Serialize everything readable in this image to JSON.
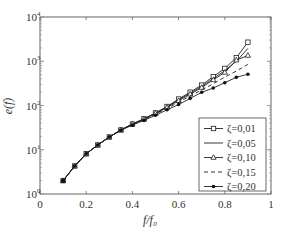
{
  "chart_data": {
    "type": "line",
    "title": "",
    "xlabel": "f/f0",
    "ylabel": "e(f)",
    "xlim": [
      0,
      1
    ],
    "ylim": [
      1,
      10000
    ],
    "yscale": "log",
    "grid": false,
    "legend_position": "lower right",
    "x_ticks": [
      "0",
      "0.2",
      "0.4",
      "0.6",
      "0.8",
      "1"
    ],
    "y_ticks": [
      "10^0",
      "10^1",
      "10^2",
      "10^3",
      "10^4"
    ],
    "x": [
      0.1,
      0.15,
      0.2,
      0.25,
      0.3,
      0.35,
      0.4,
      0.45,
      0.5,
      0.55,
      0.6,
      0.65,
      0.7,
      0.75,
      0.8,
      0.85,
      0.9
    ],
    "series": [
      {
        "name": "ζ=0,01",
        "marker": "square",
        "dash": "solid",
        "values": [
          2,
          4.3,
          8.1,
          12.8,
          19.4,
          28,
          38,
          50,
          68,
          95,
          140,
          200,
          290,
          450,
          690,
          1200,
          2700
        ]
      },
      {
        "name": "ζ=0,05",
        "marker": "none",
        "dash": "solid",
        "values": [
          2,
          4.3,
          8.1,
          12.8,
          19.4,
          28,
          38,
          50,
          67,
          93,
          135,
          190,
          270,
          410,
          610,
          1000,
          1950
        ]
      },
      {
        "name": "ζ=0,10",
        "marker": "triangle",
        "dash": "solid",
        "values": [
          2,
          4.3,
          8.1,
          12.8,
          19.4,
          28,
          38,
          49,
          66,
          90,
          128,
          180,
          255,
          380,
          560,
          1060,
          1350
        ]
      },
      {
        "name": "ζ=0,15",
        "marker": "none",
        "dash": "dashed",
        "values": [
          2,
          4.3,
          8.1,
          12.8,
          19.4,
          28,
          37,
          48,
          64,
          86,
          118,
          165,
          225,
          310,
          440,
          600,
          850
        ]
      },
      {
        "name": "ζ=0,20",
        "marker": "dot",
        "dash": "solid",
        "values": [
          2,
          4.3,
          8.1,
          12.8,
          19.4,
          27.5,
          36,
          46,
          60,
          80,
          105,
          145,
          199,
          248,
          327,
          434,
          510
        ]
      }
    ]
  },
  "axes": {
    "x_ticks": [
      "0",
      "0.2",
      "0.4",
      "0.6",
      "0.8",
      "1"
    ],
    "y_ticks": [
      {
        "base": "10",
        "exp": "0"
      },
      {
        "base": "10",
        "exp": "1"
      },
      {
        "base": "10",
        "exp": "2"
      },
      {
        "base": "10",
        "exp": "3"
      },
      {
        "base": "10",
        "exp": "4"
      }
    ],
    "xlabel": "f/f₀",
    "ylabel": "e(f)"
  },
  "legend": {
    "items": [
      "ζ=0,01",
      "ζ=0,05",
      "ζ=0,10",
      "ζ=0,15",
      "ζ=0,20"
    ]
  }
}
